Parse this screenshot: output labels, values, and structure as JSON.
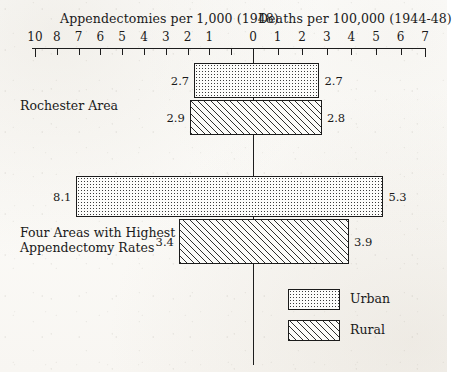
{
  "chart_data": {
    "type": "bar",
    "variant": "diverging-horizontal-bidirectional",
    "title": "",
    "left_axis": {
      "label": "Appendectomies per 1,000 (1948)",
      "ticks": [
        "10",
        "8",
        "7",
        "6",
        "5",
        "4",
        "3",
        "2",
        "1"
      ],
      "tick_values": [
        10,
        9,
        8,
        7,
        6,
        5,
        4,
        3,
        2,
        1
      ],
      "range_max": 10,
      "range_min": 0,
      "direction": "right-to-left"
    },
    "right_axis": {
      "label": "Deaths per 100,000 (1944-48)",
      "ticks": [
        "0",
        "1",
        "2",
        "3",
        "4",
        "5",
        "6",
        "7"
      ],
      "range_min": 0,
      "range_max": 7,
      "direction": "left-to-right"
    },
    "legend": {
      "position": "bottom-right",
      "entries": [
        {
          "name": "Urban",
          "fill": "dotted"
        },
        {
          "name": "Rural",
          "fill": "diagonal-hatch"
        }
      ]
    },
    "groups": [
      {
        "label": "Rochester Area",
        "bars": [
          {
            "series": "Urban",
            "left_value": 2.7,
            "right_value": 2.7,
            "left_label": "2.7",
            "right_label": "2.7"
          },
          {
            "series": "Rural",
            "left_value": 2.9,
            "right_value": 2.8,
            "left_label": "2.9",
            "right_label": "2.8"
          }
        ]
      },
      {
        "label": "Four Areas with Highest\nAppendectomy Rates",
        "bars": [
          {
            "series": "Urban",
            "left_value": 8.1,
            "right_value": 5.3,
            "left_label": "8.1",
            "right_label": "5.3"
          },
          {
            "series": "Rural",
            "left_value": 3.4,
            "right_value": 3.9,
            "left_label": "3.4",
            "right_label": "3.9"
          }
        ]
      }
    ],
    "grid": false,
    "zero_line": true
  },
  "geometry": {
    "zero_x": 253,
    "left_px_per_unit": 21.8,
    "right_px_per_unit": 24.6,
    "axis_y": 48,
    "axis_left_x": 32,
    "axis_right_x": 425,
    "zero_line_bottom": 365,
    "rows": [
      {
        "series": "Urban",
        "top": 63,
        "height": 35
      },
      {
        "series": "Rural",
        "top": 100,
        "height": 35
      },
      {
        "series": "Urban",
        "top": 176,
        "height": 41
      },
      {
        "series": "Rural",
        "top": 219,
        "height": 45
      }
    ],
    "group_label_positions": [
      {
        "left": 20,
        "top": 98
      },
      {
        "left": 20,
        "top": 225
      }
    ]
  },
  "colors": {
    "ink": "#1a1a1a",
    "line": "#1d1d1d",
    "paper": "#fdfdfb",
    "bar_border": "#1b1b1b",
    "urban_fill": "#fcfcfa",
    "rural_fill": "#fbfbf9"
  }
}
